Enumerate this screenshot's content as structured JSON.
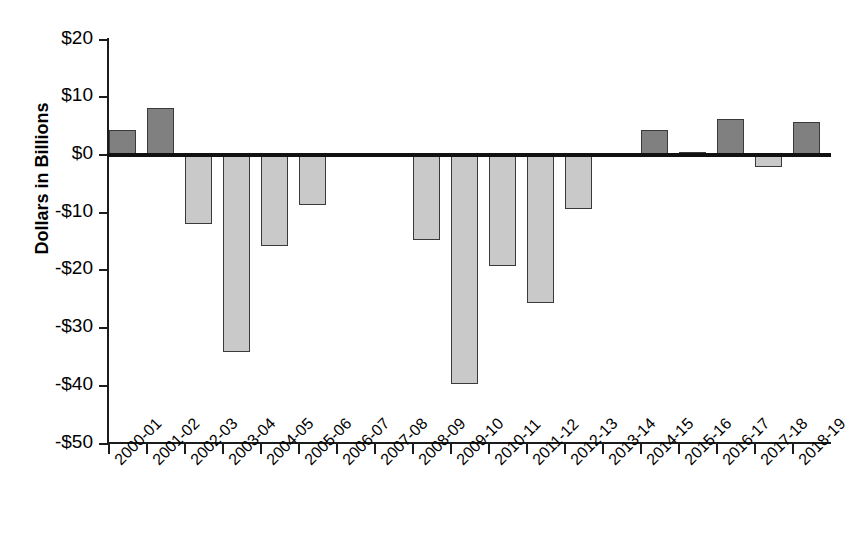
{
  "chart_data": {
    "type": "bar",
    "title": "",
    "subtitle": "",
    "xlabel": "",
    "ylabel": "Dollars in Billions",
    "ylim": [
      -50,
      20
    ],
    "ytick_values": [
      20,
      10,
      0,
      -10,
      -20,
      -30,
      -40,
      -50
    ],
    "ytick_labels": [
      "$20",
      "$10",
      "$0",
      "-$10",
      "-$20",
      "-$30",
      "-$40",
      "-$50"
    ],
    "grid": false,
    "legend": "none",
    "categories": [
      "2000-01",
      "2001-02",
      "2002-03",
      "2003-04",
      "2004-05",
      "2005-06",
      "2006-07",
      "2007-08",
      "2008-09",
      "2009-10",
      "2010-11",
      "2011-12",
      "2012-13",
      "2013-14",
      "2014-15",
      "2015-16",
      "2016-17",
      "2017-18",
      "2018-19"
    ],
    "values": [
      4.3,
      8.1,
      -12.0,
      -34.2,
      -15.7,
      -8.7,
      0,
      0,
      -14.7,
      -39.7,
      -19.2,
      -25.6,
      -9.4,
      0,
      4.4,
      0.5,
      6.2,
      -2.1,
      5.8
    ],
    "colors": {
      "positive_bar": "#808080",
      "negative_bar": "#c9c9c9",
      "bar_outline": "#3a3a3a",
      "axis": "#1c1c1c",
      "zero_line": "#111111",
      "text": "#000000",
      "background": "#ffffff"
    }
  }
}
